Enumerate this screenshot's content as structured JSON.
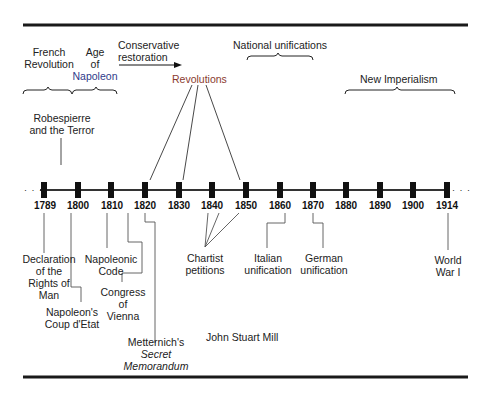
{
  "diagram": {
    "type": "timeline",
    "timeline": {
      "ticks": [
        "1789",
        "1800",
        "1810",
        "1820",
        "1830",
        "1840",
        "1850",
        "1860",
        "1870",
        "1880",
        "1890",
        "1900",
        "1914"
      ],
      "continues_left": "· · ·",
      "continues_right": "· · ·"
    },
    "above": {
      "french_revolution": {
        "line1": "French",
        "line2": "Revolution"
      },
      "age_of_napoleon": {
        "line1": "Age",
        "line2": "of",
        "line3": "Napoleon"
      },
      "conservative_restoration": {
        "line1": "Conservative",
        "line2": "restoration"
      },
      "national_unifications": "National unifications",
      "revolutions": "Revolutions",
      "new_imperialism": "New Imperialism",
      "robespierre": {
        "line1": "Robespierre",
        "line2": "and the Terror"
      }
    },
    "below": {
      "declaration": {
        "line1": "Declaration",
        "line2": "of the",
        "line3": "Rights of",
        "line4": "Man"
      },
      "coup": {
        "line1": "Napoleon's",
        "line2": "Coup d'Etat"
      },
      "napoleonic_code": {
        "line1": "Napoleonic",
        "line2": "Code"
      },
      "congress": {
        "line1": "Congress",
        "line2": "of",
        "line3": "Vienna"
      },
      "metternich": {
        "line1": "Metternich's",
        "line2": "Secret",
        "line3": "Memorandum"
      },
      "chartist": {
        "line1": "Chartist",
        "line2": "petitions"
      },
      "john_stuart_mill": "John Stuart Mill",
      "italian": {
        "line1": "Italian",
        "line2": "unification"
      },
      "german": {
        "line1": "German",
        "line2": "unification"
      },
      "wwi": {
        "line1": "World",
        "line2": "War I"
      }
    },
    "colors": {
      "revolutions_text": "#8a3a2e",
      "napoleon_text": "#2f3b8a",
      "lines": "#1a1a1a"
    }
  }
}
